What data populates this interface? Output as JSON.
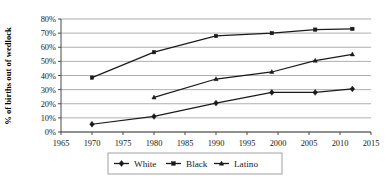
{
  "chart_data": {
    "type": "line",
    "title": "",
    "xlabel": "",
    "ylabel": "% of births out of wedlock",
    "xlim": [
      1965,
      2015
    ],
    "ylim": [
      0,
      80
    ],
    "grid": true,
    "legend_position": "bottom",
    "x_ticks": [
      "1965",
      "1970",
      "1975",
      "1980",
      "1985",
      "1990",
      "1995",
      "2000",
      "2005",
      "2010",
      "2015"
    ],
    "y_ticks": [
      "0%",
      "10%",
      "20%",
      "30%",
      "40%",
      "50%",
      "60%",
      "70%",
      "80%"
    ],
    "series": [
      {
        "name": "White",
        "marker": "diamond",
        "x": [
          1970,
          1980,
          1990,
          1999,
          2006,
          2012
        ],
        "values": [
          5.5,
          11,
          20.5,
          28,
          28,
          30.5
        ]
      },
      {
        "name": "Black",
        "marker": "square",
        "x": [
          1970,
          1980,
          1990,
          1999,
          2006,
          2012
        ],
        "values": [
          38.5,
          56.5,
          68,
          70,
          72.5,
          73
        ]
      },
      {
        "name": "Latino",
        "marker": "triangle",
        "x": [
          1980,
          1990,
          1999,
          2006,
          2012
        ],
        "values": [
          24.5,
          37.5,
          42.5,
          50.5,
          55
        ]
      }
    ]
  },
  "axis": {
    "y_title": "% of births out of wedlock"
  },
  "legend": {
    "items": [
      {
        "label": "White",
        "marker": "diamond"
      },
      {
        "label": "Black",
        "marker": "square"
      },
      {
        "label": "Latino",
        "marker": "triangle"
      }
    ]
  }
}
